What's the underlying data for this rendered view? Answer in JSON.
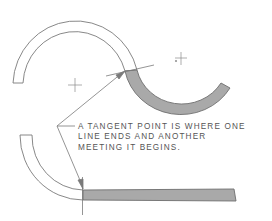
{
  "diagram": {
    "caption_lines": [
      "A TANGENT POINT IS WHERE ONE",
      "LINE ENDS AND ANOTHER",
      "MEETING IT BEGINS."
    ],
    "colors": {
      "line": "#7a7a7a",
      "shade": "#a9a9a9",
      "text": "#555555",
      "background": "#ffffff"
    },
    "elements": [
      {
        "name": "upper-arc",
        "type": "unshaded-arc-band"
      },
      {
        "name": "upper-arc-center",
        "type": "center-mark"
      },
      {
        "name": "shaded-lower-arc",
        "type": "shaded-arc-band"
      },
      {
        "name": "shaded-arc-center",
        "type": "center-mark"
      },
      {
        "name": "tangent-line",
        "type": "line"
      },
      {
        "name": "lower-curve",
        "type": "unshaded-arc-band"
      },
      {
        "name": "shaded-straight-bar",
        "type": "shaded-rectangle"
      },
      {
        "name": "tangent-vertical-line",
        "type": "line"
      },
      {
        "name": "leader-arrows",
        "type": "leader",
        "count": 2
      }
    ]
  }
}
